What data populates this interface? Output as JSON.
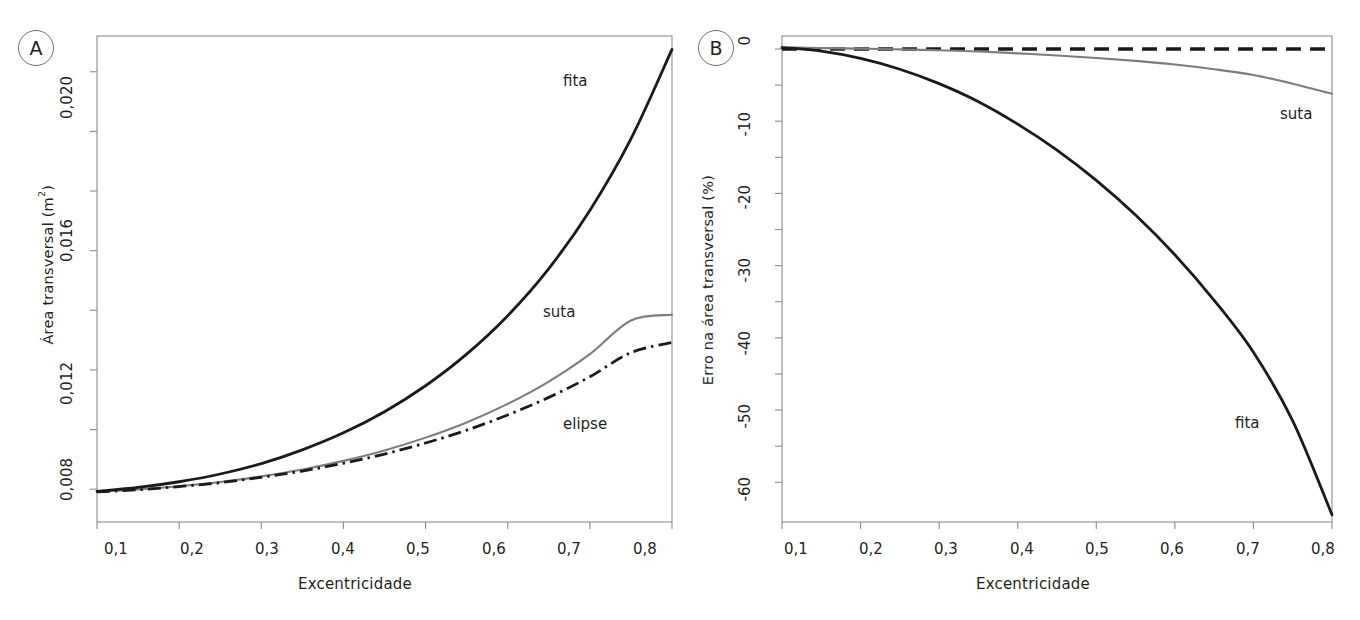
{
  "figure": {
    "background": "#ffffff",
    "panels": [
      {
        "id": "A",
        "badge": "A",
        "xlabel": "Excentricidade",
        "ylabel_main": "Área transversal (m",
        "ylabel_sup": "2",
        "ylabel_tail": ")",
        "x_ticks": [
          "0,1",
          "0,2",
          "0,3",
          "0,4",
          "0,5",
          "0,6",
          "0,7",
          "0,8"
        ],
        "y_ticks": [
          "0,008",
          "0,012",
          "0,016",
          "0,020"
        ],
        "curve_labels": [
          "fita",
          "suta",
          "elipse"
        ]
      },
      {
        "id": "B",
        "badge": "B",
        "xlabel": "Excentricidade",
        "ylabel_main": "Erro na área transversal (%)",
        "x_ticks": [
          "0,1",
          "0,2",
          "0,3",
          "0,4",
          "0,5",
          "0,6",
          "0,7",
          "0,8"
        ],
        "y_ticks": [
          "0",
          "-10",
          "-20",
          "-30",
          "-40",
          "-50",
          "-60"
        ],
        "curve_labels": [
          "suta",
          "fita"
        ]
      }
    ]
  },
  "colors": {
    "fita": "#1a1a1a",
    "suta": "#7d7d7d",
    "elipse": "#1a1a1a",
    "frame": "#8c8c8c",
    "text": "#231f20"
  },
  "chart_data": [
    {
      "type": "line",
      "panel": "A",
      "title": "",
      "xlabel": "Excentricidade",
      "ylabel": "Área transversal (m²)",
      "xlim": [
        0.1,
        0.8
      ],
      "ylim": [
        0.0069,
        0.0232
      ],
      "xticks": [
        0.1,
        0.2,
        0.3,
        0.4,
        0.5,
        0.6,
        0.7,
        0.8
      ],
      "xticklabels": [
        "0,1",
        "0,2",
        "0,3",
        "0,4",
        "0,5",
        "0,6",
        "0,7",
        "0,8"
      ],
      "yticks": [
        0.008,
        0.012,
        0.016,
        0.02
      ],
      "yticklabels": [
        "0,008",
        "0,012",
        "0,016",
        "0,020"
      ],
      "yminorticks": [
        0.01,
        0.014,
        0.018,
        0.022
      ],
      "grid": false,
      "legend": "inline-annotations",
      "x": [
        0.1,
        0.15,
        0.2,
        0.25,
        0.3,
        0.35,
        0.4,
        0.45,
        0.5,
        0.55,
        0.6,
        0.65,
        0.7,
        0.75,
        0.8
      ],
      "series": [
        {
          "name": "fita",
          "style": "solid",
          "color": "#1a1a1a",
          "label_x": 0.66,
          "label_y": 0.0224,
          "values": [
            0.00793,
            0.00806,
            0.00825,
            0.00851,
            0.00886,
            0.00932,
            0.00989,
            0.0106,
            0.01147,
            0.01253,
            0.01382,
            0.0154,
            0.01735,
            0.01975,
            0.02275
          ]
        },
        {
          "name": "suta",
          "style": "solid",
          "color": "#7d7d7d",
          "label_x": 0.645,
          "label_y": 0.01475,
          "values": [
            0.00791,
            0.00799,
            0.0081,
            0.00824,
            0.00843,
            0.00866,
            0.00895,
            0.0093,
            0.00973,
            0.01024,
            0.01086,
            0.01161,
            0.01253,
            0.01366,
            0.01385
          ]
        },
        {
          "name": "elipse",
          "style": "dashdot",
          "color": "#1a1a1a",
          "label_x": 0.655,
          "label_y": 0.01155,
          "values": [
            0.00791,
            0.00798,
            0.00809,
            0.00822,
            0.0084,
            0.00861,
            0.00887,
            0.00918,
            0.00955,
            0.00998,
            0.01049,
            0.01108,
            0.01177,
            0.01258,
            0.01292
          ]
        }
      ]
    },
    {
      "type": "line",
      "panel": "B",
      "title": "",
      "xlabel": "Excentricidade",
      "ylabel": "Erro na área transversal (%)",
      "xlim": [
        0.1,
        0.8
      ],
      "ylim": [
        -65.5,
        1.8
      ],
      "xticks": [
        0.1,
        0.2,
        0.3,
        0.4,
        0.5,
        0.6,
        0.7,
        0.8
      ],
      "xticklabels": [
        "0,1",
        "0,2",
        "0,3",
        "0,4",
        "0,5",
        "0,6",
        "0,7",
        "0,8"
      ],
      "yticks": [
        0,
        -10,
        -20,
        -30,
        -40,
        -50,
        -60
      ],
      "yticklabels": [
        "0",
        "-10",
        "-20",
        "-30",
        "-40",
        "-50",
        "-60"
      ],
      "grid": false,
      "legend": "inline-annotations",
      "x": [
        0.1,
        0.15,
        0.2,
        0.25,
        0.3,
        0.35,
        0.4,
        0.45,
        0.5,
        0.55,
        0.6,
        0.65,
        0.7,
        0.75,
        0.8
      ],
      "series": [
        {
          "name": "elipse",
          "style": "dashed",
          "color": "#1a1a1a",
          "values": [
            0,
            0,
            0,
            0,
            0,
            0,
            0,
            0,
            0,
            0,
            0,
            0,
            0,
            0,
            0
          ]
        },
        {
          "name": "suta",
          "style": "solid",
          "color": "#7d7d7d",
          "label_x": 0.685,
          "label_y": -8.3,
          "values": [
            0.25,
            0.12,
            0.05,
            -0.05,
            -0.18,
            -0.35,
            -0.6,
            -0.9,
            -1.25,
            -1.65,
            -2.15,
            -2.8,
            -3.6,
            -4.8,
            -6.2
          ]
        },
        {
          "name": "fita",
          "style": "solid",
          "color": "#1a1a1a",
          "label_x": 0.685,
          "label_y": -52.0,
          "values": [
            0.2,
            -0.3,
            -1.3,
            -2.8,
            -4.8,
            -7.3,
            -10.4,
            -14.0,
            -18.2,
            -23.0,
            -28.5,
            -34.8,
            -42.0,
            -51.5,
            -64.5
          ]
        }
      ]
    }
  ]
}
